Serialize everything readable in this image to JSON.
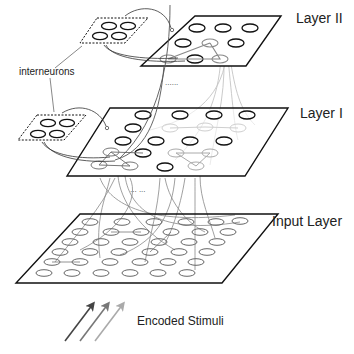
{
  "diagram": {
    "layers": [
      {
        "id": "layer2",
        "label": "Layer II"
      },
      {
        "id": "layer1",
        "label": "Layer I"
      },
      {
        "id": "input",
        "label": "Input Layer"
      }
    ],
    "interneurons_label": "interneurons",
    "stimuli_label": "Encoded Stimuli",
    "ellipsis_layer2_layer1": "......",
    "ellipsis_layer1_input": "... ...",
    "colors": {
      "stroke": "#111111",
      "light_connection": "#bbbbbb",
      "mid_connection": "#777777",
      "arrow_dark": "#444444",
      "arrow_mid": "#777777",
      "arrow_light": "#aaaaaa"
    }
  }
}
